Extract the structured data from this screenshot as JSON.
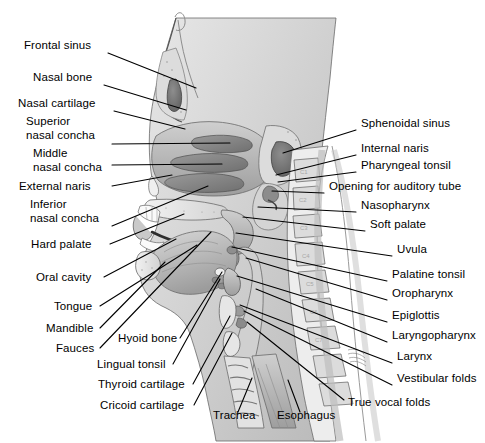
{
  "figure": {
    "background_color": "#ffffff",
    "line_color": "#000000",
    "text_color": "#000000"
  },
  "labels_left": [
    {
      "id": "frontal-sinus",
      "text": "Frontal sinus",
      "text2": "",
      "x": 24,
      "y": 49,
      "lx": 108,
      "ly": 53,
      "tx": 196,
      "ty": 88
    },
    {
      "id": "nasal-bone",
      "text": "Nasal bone",
      "text2": "",
      "x": 33,
      "y": 81,
      "lx": 104,
      "ly": 85,
      "tx": 186,
      "ty": 110
    },
    {
      "id": "nasal-cartilage",
      "text": "Nasal cartilage",
      "text2": "",
      "x": 18,
      "y": 107,
      "lx": 114,
      "ly": 111,
      "tx": 185,
      "ty": 129
    },
    {
      "id": "superior-nasal-concha",
      "text": "Superior",
      "text2": "nasal concha",
      "x": 26,
      "y": 125,
      "lx": 112,
      "ly": 144,
      "tx": 230,
      "ty": 143
    },
    {
      "id": "middle-nasal-concha",
      "text": "Middle",
      "text2": "nasal concha",
      "x": 33,
      "y": 157,
      "lx": 112,
      "ly": 165,
      "tx": 222,
      "ty": 164
    },
    {
      "id": "external-naris",
      "text": "External naris",
      "text2": "",
      "x": 19,
      "y": 190,
      "lx": 112,
      "ly": 186,
      "tx": 172,
      "ty": 175
    },
    {
      "id": "inferior-nasal-concha",
      "text": "Inferior",
      "text2": "nasal concha",
      "x": 30,
      "y": 208,
      "lx": 112,
      "ly": 226,
      "tx": 208,
      "ty": 186
    },
    {
      "id": "hard-palate",
      "text": "Hard  palate",
      "text2": "",
      "x": 31,
      "y": 248,
      "lx": 110,
      "ly": 244,
      "tx": 184,
      "ty": 214
    },
    {
      "id": "oral-cavity",
      "text": "Oral cavity",
      "text2": "",
      "x": 36,
      "y": 281,
      "lx": 104,
      "ly": 277,
      "tx": 176,
      "ty": 239
    },
    {
      "id": "tongue",
      "text": "Tongue",
      "text2": "",
      "x": 54,
      "y": 310,
      "lx": 100,
      "ly": 306,
      "tx": 197,
      "ty": 245
    },
    {
      "id": "mandible",
      "text": "Mandible",
      "text2": "",
      "x": 46,
      "y": 332,
      "lx": 100,
      "ly": 328,
      "tx": 165,
      "ty": 262
    },
    {
      "id": "fauces",
      "text": "Fauces",
      "text2": "",
      "x": 56,
      "y": 352,
      "lx": 100,
      "ly": 348,
      "tx": 211,
      "ty": 232
    },
    {
      "id": "hyoid-bone",
      "text": "Hyoid bone",
      "text2": "",
      "x": 118,
      "y": 342,
      "lx": 180,
      "ly": 338,
      "tx": 222,
      "ty": 272
    },
    {
      "id": "lingual-tonsil",
      "text": "Lingual tonsil",
      "text2": "",
      "x": 97,
      "y": 368,
      "lx": 173,
      "ly": 364,
      "tx": 220,
      "ty": 279
    },
    {
      "id": "thyroid-cartilage",
      "text": "Thyroid cartilage",
      "text2": "",
      "x": 98,
      "y": 388,
      "lx": 193,
      "ly": 384,
      "tx": 230,
      "ty": 316
    },
    {
      "id": "cricoid-cartilage",
      "text": "Cricoid cartilage",
      "text2": "",
      "x": 100,
      "y": 409,
      "lx": 194,
      "ly": 405,
      "tx": 232,
      "ty": 333
    },
    {
      "id": "trachea",
      "text": "Trachea",
      "text2": "",
      "x": 213,
      "y": 419,
      "lx": 238,
      "ly": 412,
      "tx": 252,
      "ty": 378
    },
    {
      "id": "esophagus",
      "text": "Esophagus",
      "text2": "",
      "x": 277,
      "y": 419,
      "lx": 300,
      "ly": 412,
      "tx": 288,
      "ty": 380
    }
  ],
  "labels_right": [
    {
      "id": "sphenoidal-sinus",
      "text": "Sphenoidal sinus",
      "x": 361,
      "y": 127,
      "lx": 356,
      "ly": 130,
      "tx": 283,
      "ty": 153
    },
    {
      "id": "internal-naris",
      "text": "Internal naris",
      "x": 361,
      "y": 152,
      "lx": 356,
      "ly": 155,
      "tx": 276,
      "ty": 175
    },
    {
      "id": "pharyngeal-tonsil",
      "text": "Pharyngeal tonsil",
      "x": 361,
      "y": 169,
      "lx": 356,
      "ly": 172,
      "tx": 278,
      "ty": 182
    },
    {
      "id": "opening-for-auditory-tube",
      "text": "Opening for auditory tube",
      "x": 329,
      "y": 190,
      "lx": 324,
      "ly": 193,
      "tx": 272,
      "ty": 191
    },
    {
      "id": "nasopharynx",
      "text": "Nasopharynx",
      "x": 361,
      "y": 209,
      "lx": 356,
      "ly": 212,
      "tx": 258,
      "ty": 207
    },
    {
      "id": "soft-palate",
      "text": "Soft palate",
      "x": 370,
      "y": 228,
      "lx": 365,
      "ly": 231,
      "tx": 243,
      "ty": 217
    },
    {
      "id": "uvula",
      "text": "Uvula",
      "x": 397,
      "y": 253,
      "lx": 392,
      "ly": 256,
      "tx": 236,
      "ty": 233
    },
    {
      "id": "palatine-tonsil",
      "text": "Palatine tonsil",
      "x": 392,
      "y": 278,
      "lx": 387,
      "ly": 281,
      "tx": 232,
      "ty": 247
    },
    {
      "id": "oropharynx",
      "text": "Oropharynx",
      "x": 392,
      "y": 297,
      "lx": 387,
      "ly": 300,
      "tx": 246,
      "ty": 258
    },
    {
      "id": "epiglottis",
      "text": "Epiglottis",
      "x": 392,
      "y": 319,
      "lx": 387,
      "ly": 322,
      "tx": 237,
      "ty": 276
    },
    {
      "id": "laryngopharynx",
      "text": "Laryngopharynx",
      "x": 392,
      "y": 339,
      "lx": 387,
      "ly": 342,
      "tx": 256,
      "ty": 289
    },
    {
      "id": "larynx",
      "text": "Larynx",
      "x": 397,
      "y": 360,
      "lx": 392,
      "ly": 363,
      "tx": 240,
      "ty": 305
    },
    {
      "id": "vestibular-folds",
      "text": "Vestibular folds",
      "x": 397,
      "y": 382,
      "lx": 392,
      "ly": 385,
      "tx": 244,
      "ty": 311
    },
    {
      "id": "true-vocal-folds",
      "text": "True vocal folds",
      "x": 348,
      "y": 406,
      "lx": 344,
      "ly": 400,
      "tx": 247,
      "ty": 322
    }
  ]
}
